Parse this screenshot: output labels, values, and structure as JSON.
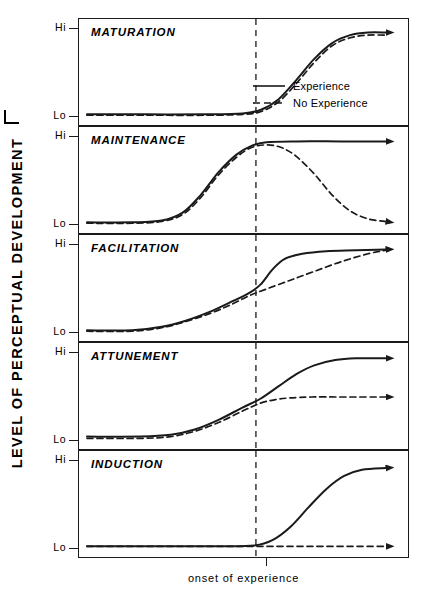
{
  "figure": {
    "y_axis_label": "LEVEL OF PERCEPTUAL DEVELOPMENT",
    "x_axis_label": "onset of experience",
    "tick_hi": "Hi",
    "tick_lo": "Lo",
    "line_color": "#1a1a1a",
    "background": "#ffffff"
  },
  "legend": {
    "position": "inside-panel-1-right",
    "entries": [
      {
        "label": "Experience",
        "style": "solid",
        "key": "solid-line-key"
      },
      {
        "label": "No Experience",
        "style": "dashed",
        "key": "dashed-line-key"
      }
    ]
  },
  "panels": [
    {
      "title": "MATURATION"
    },
    {
      "title": "MAINTENANCE"
    },
    {
      "title": "FACILITATION"
    },
    {
      "title": "ATTUNEMENT"
    },
    {
      "title": "INDUCTION"
    }
  ],
  "chart_data": {
    "type": "line",
    "title": "",
    "xlabel": "onset of experience",
    "ylabel": "LEVEL OF PERCEPTUAL DEVELOPMENT",
    "ytick_labels": [
      "Lo",
      "Hi"
    ],
    "ylim": [
      0,
      1
    ],
    "xlim": [
      0,
      1
    ],
    "grid": false,
    "legend_position": "panel-1-lower-right",
    "annotations": [
      "onset of experience"
    ],
    "onset_x": 0.565,
    "series_styles": {
      "Experience": "solid",
      "No Experience": "dashed"
    },
    "panels": [
      {
        "name": "MATURATION",
        "description": "Both curves rise identically to Hi after onset; experience is irrelevant.",
        "series": [
          {
            "name": "Experience",
            "style": "solid",
            "arrow": true,
            "points": [
              [
                0,
                0.03
              ],
              [
                0.2,
                0.03
              ],
              [
                0.4,
                0.03
              ],
              [
                0.52,
                0.04
              ],
              [
                0.58,
                0.08
              ],
              [
                0.64,
                0.2
              ],
              [
                0.7,
                0.42
              ],
              [
                0.76,
                0.66
              ],
              [
                0.82,
                0.84
              ],
              [
                0.88,
                0.93
              ],
              [
                0.94,
                0.96
              ],
              [
                1.0,
                0.96
              ]
            ]
          },
          {
            "name": "No Experience",
            "style": "dashed",
            "arrow": false,
            "points": [
              [
                0,
                0.02
              ],
              [
                0.2,
                0.02
              ],
              [
                0.4,
                0.02
              ],
              [
                0.52,
                0.03
              ],
              [
                0.58,
                0.06
              ],
              [
                0.64,
                0.17
              ],
              [
                0.7,
                0.38
              ],
              [
                0.76,
                0.62
              ],
              [
                0.82,
                0.81
              ],
              [
                0.88,
                0.9
              ],
              [
                0.94,
                0.93
              ],
              [
                1.0,
                0.93
              ]
            ]
          }
        ]
      },
      {
        "name": "MAINTENANCE",
        "description": "Both rise to Hi before onset; without experience the level decays back to Lo.",
        "series": [
          {
            "name": "Experience",
            "style": "solid",
            "arrow": true,
            "points": [
              [
                0,
                0.03
              ],
              [
                0.15,
                0.03
              ],
              [
                0.25,
                0.05
              ],
              [
                0.32,
                0.14
              ],
              [
                0.38,
                0.34
              ],
              [
                0.44,
                0.6
              ],
              [
                0.5,
                0.8
              ],
              [
                0.55,
                0.9
              ],
              [
                0.6,
                0.94
              ],
              [
                0.7,
                0.95
              ],
              [
                0.85,
                0.95
              ],
              [
                1.0,
                0.95
              ]
            ]
          },
          {
            "name": "No Experience",
            "style": "dashed",
            "arrow": true,
            "points": [
              [
                0,
                0.02
              ],
              [
                0.15,
                0.02
              ],
              [
                0.25,
                0.04
              ],
              [
                0.32,
                0.12
              ],
              [
                0.38,
                0.31
              ],
              [
                0.44,
                0.57
              ],
              [
                0.5,
                0.77
              ],
              [
                0.55,
                0.88
              ],
              [
                0.6,
                0.91
              ],
              [
                0.65,
                0.88
              ],
              [
                0.7,
                0.78
              ],
              [
                0.76,
                0.58
              ],
              [
                0.82,
                0.34
              ],
              [
                0.88,
                0.16
              ],
              [
                0.94,
                0.07
              ],
              [
                1.0,
                0.04
              ]
            ]
          }
        ]
      },
      {
        "name": "FACILITATION",
        "description": "Experience accelerates the rate of development; both reach Hi eventually.",
        "series": [
          {
            "name": "Experience",
            "style": "solid",
            "arrow": true,
            "points": [
              [
                0,
                0.03
              ],
              [
                0.15,
                0.03
              ],
              [
                0.25,
                0.07
              ],
              [
                0.33,
                0.14
              ],
              [
                0.41,
                0.24
              ],
              [
                0.48,
                0.35
              ],
              [
                0.54,
                0.45
              ],
              [
                0.58,
                0.55
              ],
              [
                0.62,
                0.72
              ],
              [
                0.66,
                0.84
              ],
              [
                0.72,
                0.9
              ],
              [
                0.8,
                0.93
              ],
              [
                0.9,
                0.94
              ],
              [
                1.0,
                0.95
              ]
            ]
          },
          {
            "name": "No Experience",
            "style": "dashed",
            "arrow": false,
            "points": [
              [
                0,
                0.02
              ],
              [
                0.15,
                0.02
              ],
              [
                0.25,
                0.06
              ],
              [
                0.33,
                0.13
              ],
              [
                0.41,
                0.22
              ],
              [
                0.48,
                0.32
              ],
              [
                0.54,
                0.42
              ],
              [
                0.6,
                0.5
              ],
              [
                0.68,
                0.6
              ],
              [
                0.76,
                0.7
              ],
              [
                0.85,
                0.81
              ],
              [
                0.94,
                0.9
              ],
              [
                1.0,
                0.94
              ]
            ]
          }
        ]
      },
      {
        "name": "ATTUNEMENT",
        "description": "Experience raises the final level; without it development plateaus partway.",
        "series": [
          {
            "name": "Experience",
            "style": "solid",
            "arrow": true,
            "points": [
              [
                0,
                0.05
              ],
              [
                0.18,
                0.05
              ],
              [
                0.28,
                0.07
              ],
              [
                0.36,
                0.13
              ],
              [
                0.44,
                0.24
              ],
              [
                0.52,
                0.38
              ],
              [
                0.58,
                0.48
              ],
              [
                0.64,
                0.62
              ],
              [
                0.7,
                0.76
              ],
              [
                0.76,
                0.86
              ],
              [
                0.83,
                0.92
              ],
              [
                0.9,
                0.94
              ],
              [
                1.0,
                0.94
              ]
            ]
          },
          {
            "name": "No Experience",
            "style": "dashed",
            "arrow": true,
            "points": [
              [
                0,
                0.03
              ],
              [
                0.18,
                0.03
              ],
              [
                0.28,
                0.05
              ],
              [
                0.36,
                0.11
              ],
              [
                0.44,
                0.21
              ],
              [
                0.52,
                0.34
              ],
              [
                0.58,
                0.43
              ],
              [
                0.63,
                0.47
              ],
              [
                0.68,
                0.49
              ],
              [
                0.75,
                0.5
              ],
              [
                0.85,
                0.5
              ],
              [
                1.0,
                0.5
              ]
            ]
          }
        ]
      },
      {
        "name": "INDUCTION",
        "description": "Development occurs only with experience; without it the level stays at Lo.",
        "series": [
          {
            "name": "Experience",
            "style": "solid",
            "arrow": true,
            "points": [
              [
                0,
                0.03
              ],
              [
                0.25,
                0.03
              ],
              [
                0.45,
                0.03
              ],
              [
                0.56,
                0.04
              ],
              [
                0.62,
                0.1
              ],
              [
                0.68,
                0.25
              ],
              [
                0.74,
                0.47
              ],
              [
                0.8,
                0.68
              ],
              [
                0.86,
                0.83
              ],
              [
                0.92,
                0.9
              ],
              [
                1.0,
                0.92
              ]
            ]
          },
          {
            "name": "No Experience",
            "style": "dashed",
            "arrow": true,
            "points": [
              [
                0,
                0.03
              ],
              [
                0.25,
                0.03
              ],
              [
                0.5,
                0.03
              ],
              [
                0.75,
                0.03
              ],
              [
                1.0,
                0.03
              ]
            ]
          }
        ]
      }
    ]
  }
}
